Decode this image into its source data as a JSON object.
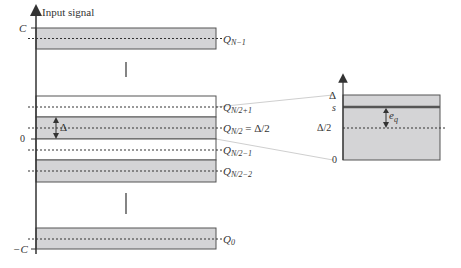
{
  "title": "Input signal",
  "axis_labels": {
    "top": "C",
    "zero": "0",
    "bottom": "−C"
  },
  "colors": {
    "band_fill": "#d4d4d6",
    "band_stroke": "#555555",
    "line": "#333333",
    "connector": "#c8c8c8",
    "white": "#ffffff"
  },
  "levels": [
    {
      "id": "q-n-minus-1",
      "label": "Q",
      "sub": "N−1",
      "suffix": "",
      "shaded": true
    },
    {
      "id": "q-n-half-plus-1",
      "label": "Q",
      "sub": "N/2+1",
      "suffix": "",
      "shaded": false
    },
    {
      "id": "q-n-half",
      "label": "Q",
      "sub": "N/2",
      "suffix": " = Δ/2",
      "shaded": true
    },
    {
      "id": "q-n-half-minus-1",
      "label": "Q",
      "sub": "N/2−1",
      "suffix": "",
      "shaded": false
    },
    {
      "id": "q-n-half-minus-2",
      "label": "Q",
      "sub": "N/2−2",
      "suffix": "",
      "shaded": true
    },
    {
      "id": "q-0",
      "label": "Q",
      "sub": "0",
      "suffix": "",
      "shaded": true
    }
  ],
  "step_label": "Δ",
  "inset": {
    "labels": {
      "delta": "Δ",
      "s": "s",
      "half_delta": "Δ/2",
      "zero": "0"
    },
    "error_label": "e",
    "error_sub": "q"
  }
}
